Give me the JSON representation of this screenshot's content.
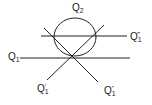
{
  "diagram": {
    "stroke_color": "#222222",
    "background": "#ffffff",
    "ellipse": {
      "label": "Q",
      "sub": "2",
      "cx": 75,
      "cy": 37,
      "rx": 21,
      "ry": 19
    },
    "lines": [
      {
        "id": "q1",
        "label": "Q",
        "sub": "1",
        "sup": "",
        "x1": 20,
        "y1": 58,
        "x2": 130,
        "y2": 58
      },
      {
        "id": "q1-triple-prime",
        "label": "Q",
        "sub": "1",
        "sup": "‴",
        "x1": 41,
        "y1": 36,
        "x2": 127,
        "y2": 36
      },
      {
        "id": "q1-prime",
        "label": "Q",
        "sub": "1",
        "sup": "′",
        "x1": 104,
        "y1": 25,
        "x2": 47,
        "y2": 80
      },
      {
        "id": "q1-double-prime",
        "label": "Q",
        "sub": "1",
        "sup": "″",
        "x1": 44,
        "y1": 28,
        "x2": 98,
        "y2": 82
      }
    ],
    "labels": {
      "q2": {
        "base": "Q",
        "sub": "2",
        "sup": ""
      },
      "q1": {
        "base": "Q",
        "sub": "1",
        "sup": ""
      },
      "q1_triple_prime": {
        "base": "Q",
        "sub": "1",
        "sup": "‴"
      },
      "q1_prime": {
        "base": "Q",
        "sub": "1",
        "sup": "′"
      },
      "q1_double_prime": {
        "base": "Q",
        "sub": "1",
        "sup": "″"
      }
    }
  }
}
